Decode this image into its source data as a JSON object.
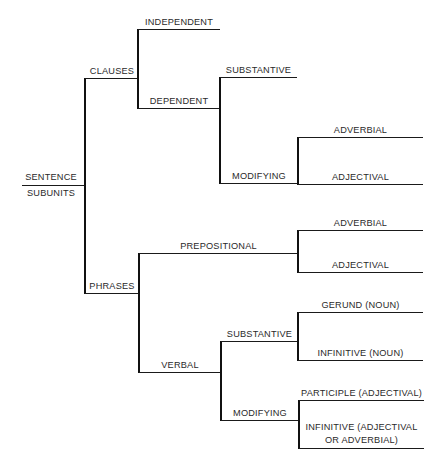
{
  "diagram": {
    "type": "tree",
    "orientation": "left-to-right",
    "line_color": "#111111",
    "text_color": "#2a2a2a",
    "background": "#ffffff",
    "root": {
      "line1": "SENTENCE",
      "line2": "SUBUNITS"
    },
    "clauses": {
      "label": "CLAUSES",
      "independent": "INDEPENDENT",
      "dependent": {
        "label": "DEPENDENT",
        "substantive": "SUBSTANTIVE",
        "modifying": {
          "label": "MODIFYING",
          "adverbial": "ADVERBIAL",
          "adjectival": "ADJECTIVAL"
        }
      }
    },
    "phrases": {
      "label": "PHRASES",
      "prepositional": {
        "label": "PREPOSITIONAL",
        "adverbial": "ADVERBIAL",
        "adjectival": "ADJECTIVAL"
      },
      "verbal": {
        "label": "VERBAL",
        "substantive": {
          "label": "SUBSTANTIVE",
          "gerund": "GERUND (NOUN)",
          "infinitive": "INFINITIVE (NOUN)"
        },
        "modifying": {
          "label": "MODIFYING",
          "participle": "PARTICIPLE (ADJECTIVAL)",
          "infinitive_line1": "INFINITIVE (ADJECTIVAL",
          "infinitive_line2": "OR ADVERBIAL)"
        }
      }
    }
  }
}
